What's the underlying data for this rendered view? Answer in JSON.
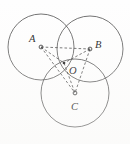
{
  "figure": {
    "type": "geometry-diagram",
    "canvas": {
      "width": 130,
      "height": 144,
      "background": "#fefefe"
    },
    "stroke_color": "#4a4a4a",
    "dash_color": "#3a3a3a",
    "label_color": "#1a1a1a",
    "points": [
      {
        "id": "A",
        "label": "A",
        "cx": 41,
        "cy": 47,
        "label_x": 29,
        "label_y": 42,
        "marker": "small-circle"
      },
      {
        "id": "B",
        "label": "B",
        "cx": 90,
        "cy": 49,
        "label_x": 95,
        "label_y": 48,
        "marker": "small-circle"
      },
      {
        "id": "C",
        "label": "C",
        "cx": 75,
        "cy": 93,
        "label_x": 71,
        "label_y": 110,
        "marker": "small-circle"
      },
      {
        "id": "O",
        "label": "O",
        "cx": 64,
        "cy": 63,
        "label_x": 69,
        "label_y": 74,
        "marker": "dot"
      }
    ],
    "circles": [
      {
        "id": "circle-A",
        "center": "A",
        "cx": 41,
        "cy": 47,
        "r": 33
      },
      {
        "id": "circle-B",
        "center": "B",
        "cx": 90,
        "cy": 49,
        "r": 33
      },
      {
        "id": "circle-C",
        "center": "C",
        "cx": 75,
        "cy": 93,
        "r": 34
      }
    ],
    "segments": [
      {
        "id": "A-B",
        "from": "A",
        "to": "B",
        "style": "dashed",
        "x1": 41,
        "y1": 47,
        "x2": 90,
        "y2": 49
      },
      {
        "id": "A-O",
        "from": "A",
        "to": "O",
        "style": "dashed",
        "x1": 41,
        "y1": 47,
        "x2": 64,
        "y2": 63
      },
      {
        "id": "B-O",
        "from": "B",
        "to": "O",
        "style": "dashed",
        "x1": 90,
        "y1": 49,
        "x2": 64,
        "y2": 63
      },
      {
        "id": "A-C",
        "from": "A",
        "to": "C",
        "style": "dashed",
        "x1": 41,
        "y1": 47,
        "x2": 75,
        "y2": 93
      },
      {
        "id": "B-C",
        "from": "B",
        "to": "C",
        "style": "dashed",
        "x1": 90,
        "y1": 49,
        "x2": 75,
        "y2": 93
      },
      {
        "id": "O-C",
        "from": "O",
        "to": "C",
        "style": "dashed",
        "x1": 64,
        "y1": 63,
        "x2": 75,
        "y2": 93
      }
    ]
  }
}
